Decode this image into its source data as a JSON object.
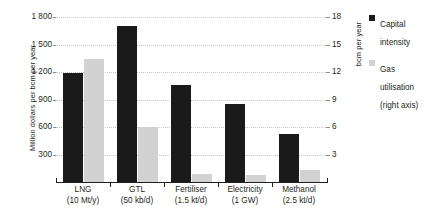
{
  "chart_data": {
    "type": "bar",
    "title": "",
    "subtitle": "",
    "xlabel": "",
    "ylabel": "Million dollars per bcm per year",
    "y2label": "bcm per year",
    "grid": true,
    "legend_position": "right",
    "ylim": [
      0,
      1800
    ],
    "y2lim": [
      0,
      18
    ],
    "yticks": [
      "300",
      "600",
      "900",
      "1 200",
      "1 500",
      "1 800"
    ],
    "ytick_values": [
      300,
      600,
      900,
      1200,
      1500,
      1800
    ],
    "y2ticks": [
      "3",
      "6",
      "9",
      "12",
      "15",
      "18"
    ],
    "y2tick_values": [
      3,
      6,
      9,
      12,
      15,
      18
    ],
    "categories": [
      "LNG",
      "GTL",
      "Fertiliser",
      "Electricity",
      "Methanol"
    ],
    "category_sublabels": [
      "(10 Mt/y)",
      "(50 kb/d)",
      "(1.5 kt/d)",
      "(1 GW)",
      "(2.5 kt/d)"
    ],
    "series": [
      {
        "name": "Capital intensity",
        "axis": "left",
        "color": "#1a1a1a",
        "values": [
          1185,
          1700,
          1060,
          855,
          520
        ]
      },
      {
        "name": "Gas utilisation",
        "axis": "right",
        "color": "#d2d2d2",
        "values": [
          13.4,
          6.0,
          0.9,
          0.75,
          1.3
        ]
      }
    ]
  },
  "legend": {
    "items": [
      {
        "label": "Capital\nintensity",
        "color": "#1a1a1a",
        "swatch_name": "capital-intensity"
      },
      {
        "label": "Gas\nutilisation\n(right axis)",
        "color": "#d2d2d2",
        "swatch_name": "gas-utilisation"
      }
    ]
  },
  "colors": {
    "capital_intensity": "#1a1a1a",
    "gas_utilisation": "#d2d2d2",
    "axis": "#231f20",
    "gridline": "#c9c9c9",
    "background": "#ffffff"
  }
}
